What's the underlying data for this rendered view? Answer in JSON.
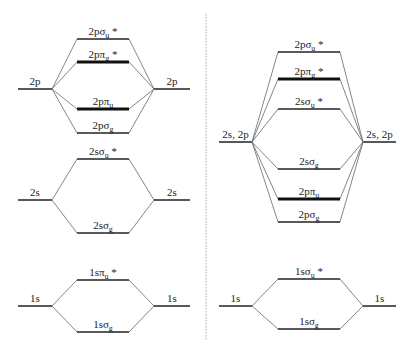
{
  "diagram": {
    "type": "molecular-orbital-energy-diagram",
    "colors": {
      "line": "#222222",
      "connector": "#666666",
      "divider": "#aaaaaa"
    },
    "left_panel": {
      "groups": [
        {
          "atomic_orbital": "2p",
          "ao_y": 89,
          "orbitals": [
            {
              "base": "2pσ",
              "sub": "u",
              "star": "*",
              "y": 39,
              "thick": false
            },
            {
              "base": "2pπ",
              "sub": "g",
              "star": "*",
              "y": 62,
              "thick": true
            },
            {
              "base": "2pπ",
              "sub": "u",
              "star": "",
              "y": 109,
              "thick": true
            },
            {
              "base": "2pσ",
              "sub": "g",
              "star": "",
              "y": 133,
              "thick": false
            }
          ]
        },
        {
          "atomic_orbital": "2s",
          "ao_y": 200,
          "orbitals": [
            {
              "base": "2sσ",
              "sub": "u",
              "star": "*",
              "y": 159,
              "thick": false
            },
            {
              "base": "2sσ",
              "sub": "g",
              "star": "",
              "y": 233,
              "thick": false
            }
          ]
        },
        {
          "atomic_orbital": "1s",
          "ao_y": 306,
          "orbitals": [
            {
              "base": "1sπ",
              "sub": "u",
              "star": "*",
              "y": 280,
              "thick": false
            },
            {
              "base": "1sσ",
              "sub": "g",
              "star": "",
              "y": 332,
              "thick": false
            }
          ]
        }
      ]
    },
    "right_panel": {
      "groups": [
        {
          "atomic_orbital": "2s, 2p",
          "ao_y": 142,
          "orbitals": [
            {
              "base": "2pσ",
              "sub": "u",
              "star": "*",
              "y": 52,
              "thick": false
            },
            {
              "base": "2pπ",
              "sub": "g",
              "star": "*",
              "y": 79,
              "thick": true
            },
            {
              "base": "2sσ",
              "sub": "u",
              "star": "*",
              "y": 109,
              "thick": false
            },
            {
              "base": "2sσ",
              "sub": "g",
              "star": "",
              "y": 169,
              "thick": false
            },
            {
              "base": "2pπ",
              "sub": "u",
              "star": "",
              "y": 199,
              "thick": true
            },
            {
              "base": "2pσ",
              "sub": "g",
              "star": "",
              "y": 222,
              "thick": false
            }
          ]
        },
        {
          "atomic_orbital": "1s",
          "ao_y": 306,
          "orbitals": [
            {
              "base": "1sσ",
              "sub": "u",
              "star": "*",
              "y": 279,
              "thick": false
            },
            {
              "base": "1sσ",
              "sub": "g",
              "star": "",
              "y": 329,
              "thick": false
            }
          ]
        }
      ]
    }
  }
}
